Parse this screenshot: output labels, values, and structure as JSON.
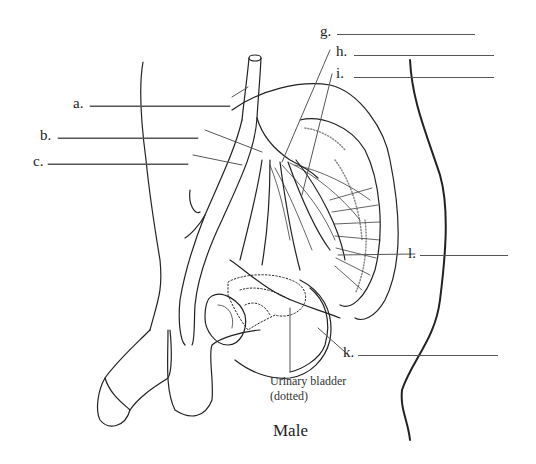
{
  "diagram": {
    "caption": "Male",
    "note": {
      "line1": "Urinary bladder",
      "line2": "(dotted)"
    },
    "labels": [
      {
        "id": "a",
        "text": "a."
      },
      {
        "id": "b",
        "text": "b."
      },
      {
        "id": "c",
        "text": "c."
      },
      {
        "id": "g",
        "text": "g."
      },
      {
        "id": "h",
        "text": "h."
      },
      {
        "id": "i",
        "text": "i."
      },
      {
        "id": "k",
        "text": "k."
      },
      {
        "id": "l",
        "text": "l."
      }
    ],
    "answers": {
      "a": "",
      "b": "",
      "c": "",
      "g": "",
      "h": "",
      "i": "",
      "k": "",
      "l": ""
    },
    "colors": {
      "ink": "#222222",
      "leader": "#555555",
      "background": "#ffffff"
    }
  }
}
